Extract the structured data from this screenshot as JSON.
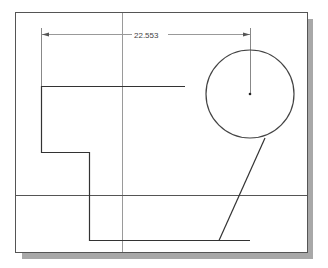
{
  "drawing": {
    "frame": {
      "x": 15,
      "y": 12,
      "w": 292,
      "h": 240,
      "stroke": "#555555",
      "shadow": "#a8a8a8"
    },
    "dimension": {
      "label": "22.553",
      "x1": 41,
      "x2": 250,
      "y": 34
    },
    "reference_lines": {
      "vertical_x": 122,
      "horizontal_y": 195,
      "color": "#888888"
    },
    "profile": {
      "points": "185,86 41,86 41,152 89,152 89,240 250,240",
      "color": "#333333"
    },
    "circle": {
      "cx": 250,
      "cy": 94,
      "r": 44,
      "color": "#444444"
    },
    "slant_line": {
      "x1": 265,
      "y1": 138,
      "x2": 219,
      "y2": 240
    }
  }
}
